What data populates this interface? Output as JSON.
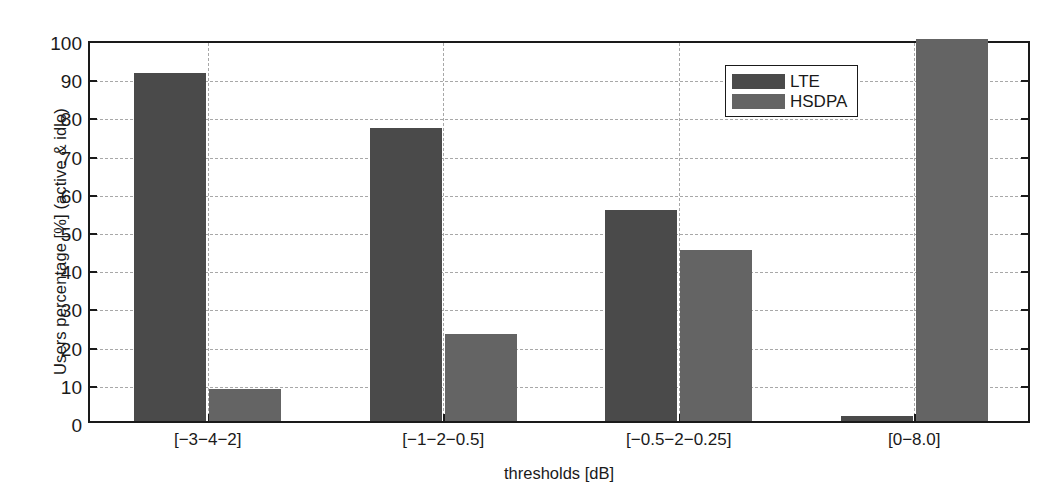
{
  "chart_data": {
    "type": "bar",
    "title": "",
    "xlabel": "thresholds [dB]",
    "ylabel": "Users percentage [%] (active & idle)",
    "categories": [
      "[−3−4−2]",
      "[−1−2−0.5]",
      "[−0.5−2−0.25]",
      "[0−8.0]"
    ],
    "series": [
      {
        "name": "LTE",
        "color": "#4a4a4a",
        "values": [
          91.0,
          76.7,
          55.2,
          1.3
        ]
      },
      {
        "name": "HSDPA",
        "color": "#646464",
        "values": [
          8.4,
          22.7,
          44.7,
          100.0
        ]
      }
    ],
    "ylim": [
      0,
      100
    ],
    "ytick_labels": [
      "0",
      "10",
      "20",
      "30",
      "40",
      "50",
      "60",
      "70",
      "80",
      "90",
      "100"
    ],
    "ytick_values": [
      0,
      10,
      20,
      30,
      40,
      50,
      60,
      70,
      80,
      90,
      100
    ],
    "grid": "dashed-both-axes",
    "legend_position": "top-right-inside",
    "axis_color": "#1a1a1a",
    "grid_color": "#a8a8a8",
    "background": "#ffffff"
  },
  "legend": {
    "entries": [
      {
        "label": "LTE",
        "color": "#4a4a4a"
      },
      {
        "label": "HSDPA",
        "color": "#646464"
      }
    ]
  },
  "axes": {
    "x_title": "thresholds [dB]",
    "y_title": "Users percentage [%] (active & idle)"
  }
}
